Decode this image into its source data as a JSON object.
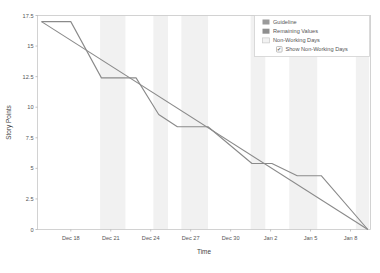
{
  "chart_data": {
    "type": "line",
    "title": "",
    "xlabel": "Time",
    "ylabel": "Story Points",
    "grid": false,
    "legend_position": "top-right",
    "ylim": [
      0,
      17.5
    ],
    "yticks": [
      "0",
      "2.5",
      "5",
      "7.5",
      "10",
      "12.5",
      "15",
      "17.5"
    ],
    "ytick_values": [
      0,
      2.5,
      5,
      7.5,
      10,
      12.5,
      15,
      17.5
    ],
    "xticks": [
      "Dec 18",
      "Dec 21",
      "Dec 24",
      "Dec 27",
      "Dec 30",
      "Jan 2",
      "Jan 5",
      "Jan 8"
    ],
    "xtick_values": [
      18,
      21,
      24,
      27,
      30,
      33,
      36,
      39
    ],
    "xlim": [
      15.5,
      40.5
    ],
    "series": [
      {
        "name": "Guideline",
        "color": "#8a8a8a",
        "type": "line",
        "x": [
          15.8,
          40.3
        ],
        "values": [
          17.0,
          0.0
        ]
      },
      {
        "name": "Remaining Values",
        "color": "#8a8a8a",
        "type": "step",
        "x": [
          15.8,
          18.0,
          20.3,
          22.9,
          24.6,
          26.0,
          28.3,
          31.6,
          33.1,
          35.0,
          36.8,
          40.3
        ],
        "values": [
          17.0,
          17.0,
          12.4,
          12.4,
          9.4,
          8.4,
          8.4,
          5.4,
          5.4,
          4.4,
          4.4,
          0.0
        ]
      }
    ],
    "non_working_bands": [
      {
        "start": 20.2,
        "end": 22.1
      },
      {
        "start": 24.2,
        "end": 25.3
      },
      {
        "start": 26.3,
        "end": 28.3
      },
      {
        "start": 31.5,
        "end": 32.6
      },
      {
        "start": 34.4,
        "end": 36.5
      },
      {
        "start": 39.4,
        "end": 40.4
      }
    ],
    "annotations": []
  },
  "legend": {
    "items": [
      {
        "label": "Guideline",
        "swatch": "#9a9a9a",
        "kind": "swatch"
      },
      {
        "label": "Remaining Values",
        "swatch": "#8f8f8f",
        "kind": "swatch"
      },
      {
        "label": "Non-Working Days",
        "swatch": "#f2f2f2",
        "kind": "swatch-outline"
      }
    ],
    "checkbox": {
      "label": "Show Non-Working Days",
      "checked": true,
      "mark": "✔"
    }
  },
  "colors": {
    "background": "#ffffff",
    "plot_border": "#c8c8c8",
    "axis_line": "#b4b4b4",
    "tick_text": "#555555",
    "guideline": "#9a9a9a",
    "remaining": "#8f8f8f",
    "band": "#f1f1f1",
    "legend_border": "#d2d2d2"
  }
}
